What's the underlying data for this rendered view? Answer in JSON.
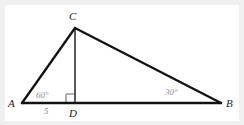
{
  "figure": {
    "type": "geometry-diagram",
    "width": 244,
    "height": 125,
    "background_color": "#ffffff",
    "frame_color": "#f0f0f0",
    "stroke_color": "#111111",
    "altitude_color": "#3a3a3a",
    "label_color": "#1a1a1a",
    "measure_color": "#8c8c8c"
  },
  "vertices": {
    "a": {
      "label": "A",
      "x": 22,
      "y": 103,
      "label_x": 8,
      "label_y": 98
    },
    "b": {
      "label": "B",
      "x": 221,
      "y": 103,
      "label_x": 226,
      "label_y": 98
    },
    "c": {
      "label": "C",
      "x": 75,
      "y": 28,
      "label_x": 69,
      "label_y": 11
    },
    "d": {
      "label": "D",
      "x": 75,
      "y": 103,
      "label_x": 69,
      "label_y": 108
    }
  },
  "segments": {
    "ab": {
      "name": "base-AB",
      "x1": 22,
      "y1": 103,
      "x2": 221,
      "y2": 103
    },
    "ac": {
      "name": "side-AC",
      "x1": 22,
      "y1": 103,
      "x2": 75,
      "y2": 28
    },
    "cb": {
      "name": "side-CB",
      "x1": 75,
      "y1": 28,
      "x2": 221,
      "y2": 103
    },
    "cd": {
      "name": "altitude-CD",
      "x1": 75,
      "y1": 28,
      "x2": 75,
      "y2": 103
    }
  },
  "angles": {
    "at_a": {
      "value": "60°",
      "label_x": 36,
      "label_y": 91
    },
    "at_b": {
      "value": "30°",
      "label_x": 165,
      "label_y": 88
    },
    "at_d": {
      "value": "90°",
      "marker": "right-angle-square",
      "size": 9
    }
  },
  "measurements": {
    "ad": {
      "value": "5",
      "label_x": 44,
      "label_y": 107
    }
  },
  "right_angle_marker": {
    "x": 66,
    "y": 94,
    "size": 9,
    "color": "#9a9a9a"
  }
}
